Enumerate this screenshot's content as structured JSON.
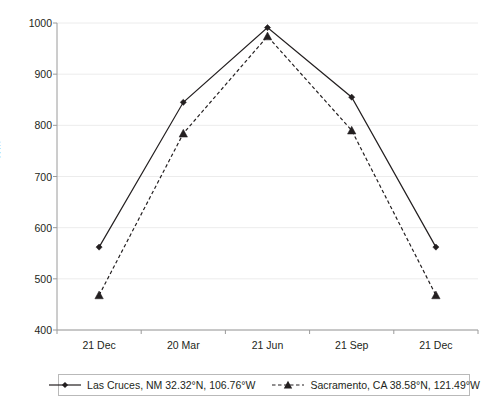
{
  "chart_data": {
    "type": "line",
    "title": "",
    "xlabel": "",
    "ylabel": "Wm-2",
    "ylabel_base": "Wm",
    "ylabel_exponent": "-2",
    "categories": [
      "21 Dec",
      "20 Mar",
      "21 Jun",
      "21 Sep",
      "21 Dec"
    ],
    "ylim": [
      400,
      1000
    ],
    "yticks": [
      1000,
      900,
      800,
      700,
      600,
      500,
      400
    ],
    "grid": true,
    "legend_position": "bottom",
    "series": [
      {
        "name": "Las Cruces, NM 32.32°N, 106.76°W",
        "name_prefix": "Las Cruces, NM 32.32",
        "name_mid": "N, 106.76",
        "name_suffix": "W",
        "style": "solid",
        "marker": "diamond",
        "color": "#231f20",
        "values": [
          562,
          845,
          991,
          855,
          562
        ]
      },
      {
        "name": "Sacramento, CA 38.58°N, 121.49°W",
        "name_prefix": "Sacramento, CA 38.58",
        "name_mid": "N, 121.49",
        "name_suffix": "W",
        "style": "dashed",
        "marker": "triangle",
        "color": "#231f20",
        "values": [
          468,
          784,
          974,
          790,
          468
        ]
      }
    ]
  },
  "legend": {
    "entries": [
      {
        "label": "Las Cruces, NM 32.32°N, 106.76°W"
      },
      {
        "label": "Sacramento, CA 38.58°N, 121.49°W"
      }
    ]
  },
  "colors": {
    "ink": "#231f20",
    "grid": "#ececec",
    "axis": "#9a9a9a",
    "legend_border": "#b9b9b9",
    "background": "#ffffff"
  }
}
